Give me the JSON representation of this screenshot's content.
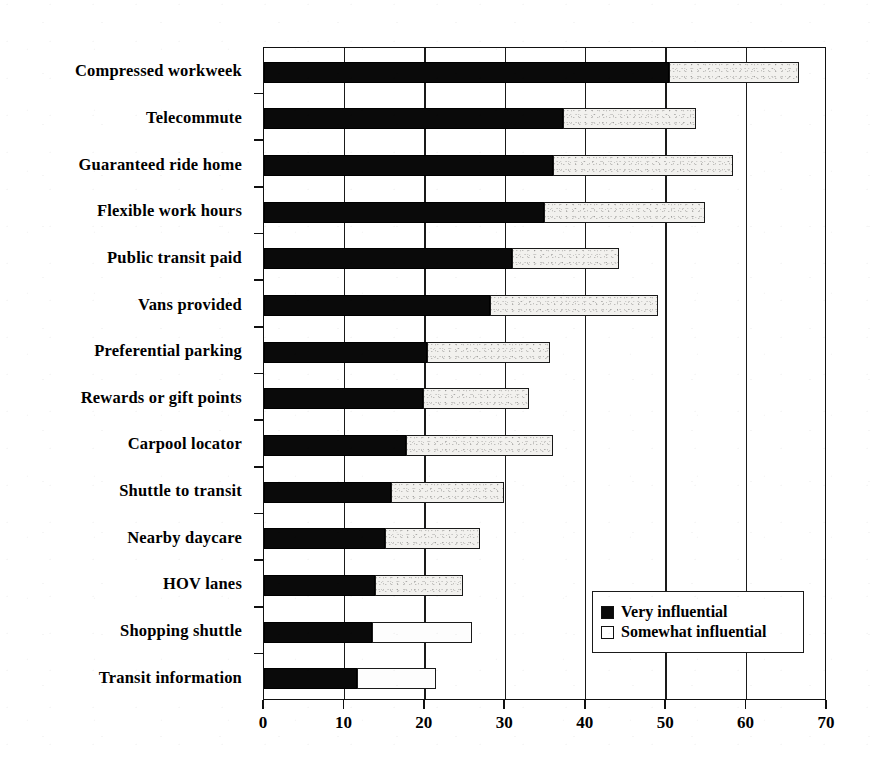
{
  "chart_data": {
    "type": "bar",
    "orientation": "horizontal",
    "stacked": true,
    "title": "",
    "xlabel": "",
    "ylabel": "",
    "xlim": [
      0,
      70
    ],
    "xticks": [
      0,
      10,
      20,
      30,
      40,
      50,
      60,
      70
    ],
    "xtick_labels": [
      "0",
      "10",
      "20",
      "30",
      "40",
      "50",
      "60",
      "70"
    ],
    "grid": "vertical",
    "legend_position": "inside-lower-right",
    "categories": [
      "Compressed workweek",
      "Telecommute",
      "Guaranteed ride home",
      "Flexible work hours",
      "Public transit paid",
      "Vans provided",
      "Preferential parking",
      "Rewards or gift points",
      "Carpool locator",
      "Shuttle to transit",
      "Nearby daycare",
      "HOV lanes",
      "Shopping shuttle",
      "Transit information"
    ],
    "series": [
      {
        "name": "Very influential",
        "color": "#0a0a0a",
        "values": [
          50.4,
          37.2,
          35.9,
          34.8,
          30.8,
          28.1,
          20.3,
          19.8,
          17.6,
          15.8,
          15.1,
          13.8,
          13.4,
          11.6
        ]
      },
      {
        "name": "Somewhat influential",
        "color": "#f2f1ee",
        "values": [
          16.1,
          16.5,
          22.4,
          20.0,
          13.4,
          20.9,
          15.3,
          13.2,
          18.3,
          14.0,
          11.8,
          11.0,
          12.5,
          9.8
        ]
      }
    ],
    "totals": [
      66.5,
      53.7,
      58.3,
      54.8,
      44.2,
      49.0,
      35.6,
      33.0,
      35.9,
      29.8,
      26.9,
      24.8,
      25.9,
      21.4
    ]
  },
  "legend": {
    "items": [
      {
        "label": "Very influential",
        "swatch": "filled"
      },
      {
        "label": "Somewhat influential",
        "swatch": "hollow"
      }
    ]
  }
}
